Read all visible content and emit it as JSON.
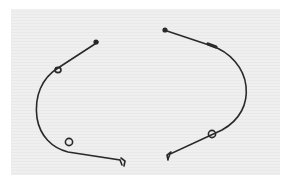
{
  "image": {
    "description": "Product photo of two curved metal wire pieces (mirror-image pair) with small loops, on a light gray background",
    "background_color": "#ececec",
    "wire_color": "#2a2a2a",
    "objects": [
      {
        "name": "left-wire",
        "label": "Left curved wire with two loops"
      },
      {
        "name": "right-wire",
        "label": "Right curved wire with one loop and a sleeve"
      }
    ]
  }
}
